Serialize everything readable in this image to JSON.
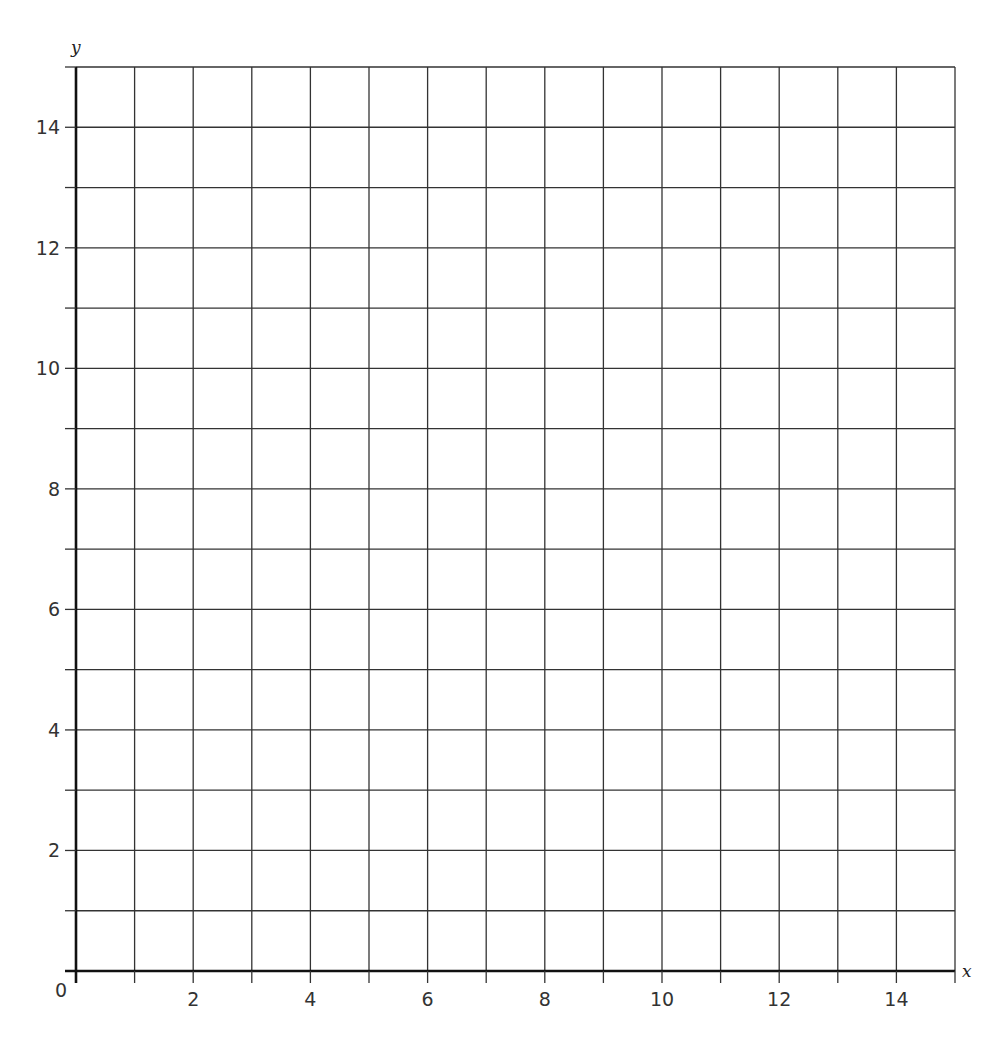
{
  "chart_data": {
    "type": "scatter",
    "title": "",
    "xlabel": "x",
    "ylabel": "y",
    "xlim": [
      0,
      15
    ],
    "ylim": [
      0,
      15
    ],
    "grid": true,
    "grid_step": 1,
    "origin_label": "0",
    "x_tick_labels": [
      "2",
      "4",
      "6",
      "8",
      "10",
      "12",
      "14"
    ],
    "x_tick_values": [
      2,
      4,
      6,
      8,
      10,
      12,
      14
    ],
    "y_tick_labels": [
      "2",
      "4",
      "6",
      "8",
      "10",
      "12",
      "14"
    ],
    "y_tick_values": [
      2,
      4,
      6,
      8,
      10,
      12,
      14
    ],
    "series": [],
    "colors": {
      "grid": "#333333",
      "axis": "#111111",
      "text": "#333333"
    }
  }
}
